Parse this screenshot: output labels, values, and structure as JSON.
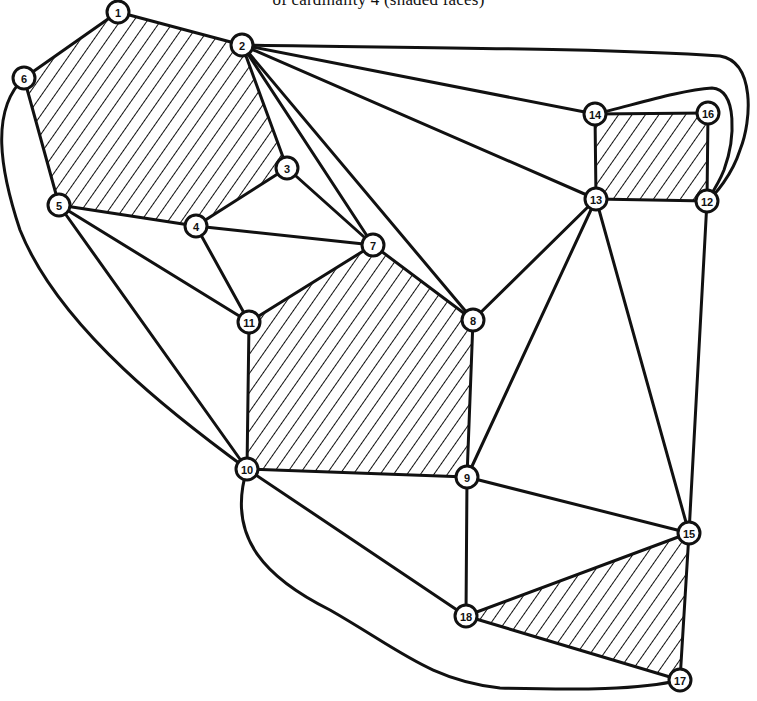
{
  "caption": "of cardinality 4 (shaded faces)",
  "colors": {
    "ink": "#111111",
    "paper": "#ffffff"
  },
  "nodes": [
    {
      "id": "1",
      "x": 118,
      "y": 12
    },
    {
      "id": "2",
      "x": 242,
      "y": 45
    },
    {
      "id": "3",
      "x": 287,
      "y": 168
    },
    {
      "id": "4",
      "x": 196,
      "y": 226
    },
    {
      "id": "5",
      "x": 59,
      "y": 205
    },
    {
      "id": "6",
      "x": 24,
      "y": 78
    },
    {
      "id": "7",
      "x": 373,
      "y": 245
    },
    {
      "id": "8",
      "x": 473,
      "y": 320
    },
    {
      "id": "9",
      "x": 467,
      "y": 477
    },
    {
      "id": "10",
      "x": 247,
      "y": 469
    },
    {
      "id": "11",
      "x": 249,
      "y": 322
    },
    {
      "id": "12",
      "x": 707,
      "y": 201
    },
    {
      "id": "13",
      "x": 596,
      "y": 199
    },
    {
      "id": "14",
      "x": 595,
      "y": 114
    },
    {
      "id": "15",
      "x": 689,
      "y": 533
    },
    {
      "id": "16",
      "x": 708,
      "y": 113
    },
    {
      "id": "17",
      "x": 680,
      "y": 680
    },
    {
      "id": "18",
      "x": 466,
      "y": 616
    }
  ],
  "edges": [
    [
      "1",
      "2"
    ],
    [
      "1",
      "6"
    ],
    [
      "2",
      "3"
    ],
    [
      "2",
      "7"
    ],
    [
      "2",
      "8"
    ],
    [
      "2",
      "13"
    ],
    [
      "2",
      "14"
    ],
    [
      "3",
      "4"
    ],
    [
      "3",
      "7"
    ],
    [
      "4",
      "5"
    ],
    [
      "4",
      "7"
    ],
    [
      "4",
      "11"
    ],
    [
      "5",
      "6"
    ],
    [
      "5",
      "11"
    ],
    [
      "5",
      "10"
    ],
    [
      "7",
      "11"
    ],
    [
      "7",
      "8"
    ],
    [
      "8",
      "13"
    ],
    [
      "8",
      "9"
    ],
    [
      "9",
      "13"
    ],
    [
      "9",
      "10"
    ],
    [
      "9",
      "18"
    ],
    [
      "9",
      "15"
    ],
    [
      "10",
      "11"
    ],
    [
      "10",
      "18"
    ],
    [
      "13",
      "14"
    ],
    [
      "13",
      "12"
    ],
    [
      "13",
      "15"
    ],
    [
      "14",
      "16"
    ],
    [
      "16",
      "12"
    ],
    [
      "12",
      "15"
    ],
    [
      "15",
      "18"
    ],
    [
      "15",
      "17"
    ],
    [
      "17",
      "18"
    ]
  ],
  "curved_edges": [
    {
      "from": "6",
      "to": "10",
      "path": "M24,78 C-10,110 0,170 20,230 C60,330 180,420 247,469"
    },
    {
      "from": "10",
      "to": "17",
      "path": "M247,469 C225,540 270,580 330,610 C400,650 430,680 500,688 C580,690 640,690 680,680"
    },
    {
      "from": "2",
      "to": "12",
      "path": "M242,45 C420,48 600,48 720,56 C755,62 752,120 740,150 C732,175 715,195 707,201"
    },
    {
      "from": "14",
      "to": "12",
      "path": "M595,114 C630,106 680,90 712,88 C738,90 735,140 724,170 C718,185 710,196 707,201"
    }
  ],
  "shaded_faces": [
    {
      "name": "face-1-2-3-4-5-6",
      "nodes": [
        "1",
        "2",
        "3",
        "4",
        "5",
        "6"
      ]
    },
    {
      "name": "face-7-8-9-10-11",
      "nodes": [
        "7",
        "8",
        "9",
        "10",
        "11"
      ]
    },
    {
      "name": "face-14-16-12-13",
      "nodes": [
        "14",
        "16",
        "12",
        "13"
      ]
    },
    {
      "name": "face-15-17-18",
      "nodes": [
        "15",
        "17",
        "18"
      ]
    }
  ]
}
